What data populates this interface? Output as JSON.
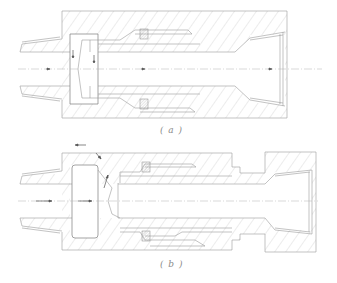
{
  "figure": {
    "type": "mechanical cross-section drawing",
    "subfigures": [
      {
        "id": "a",
        "caption": "( a )"
      },
      {
        "id": "b",
        "caption": "( b )"
      }
    ]
  },
  "colors": {
    "line": "#9a9a9a",
    "hatch": "#b4b4b4",
    "arrow": "#555555",
    "background": "#ffffff"
  }
}
